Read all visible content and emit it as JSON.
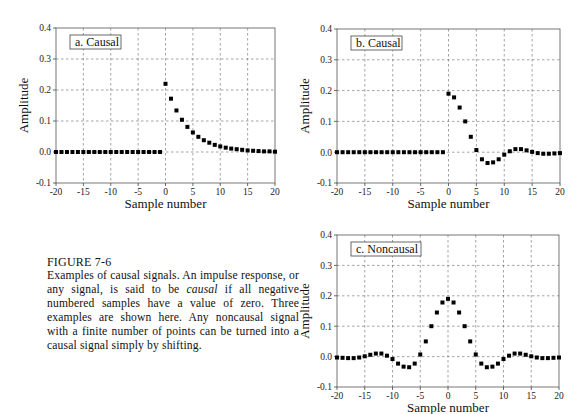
{
  "caption": {
    "title": "FIGURE 7-6",
    "body_part1": "Examples of causal signals. An impulse response, or any signal, is said to be ",
    "body_italic": "causal",
    "body_part2": " if all negative numbered samples have a value of zero.  Three examples are shown here. Any noncausal signal with a finite number of points can be turned into a causal signal simply by shifting."
  },
  "chart_data": [
    {
      "id": "a",
      "type": "scatter",
      "title": "a.  Causal",
      "xlabel": "Sample number",
      "ylabel": "Amplitude",
      "xlim": [
        -20,
        20
      ],
      "ylim": [
        -0.1,
        0.4
      ],
      "xticks": [
        -20,
        -15,
        -10,
        -5,
        0,
        5,
        10,
        15,
        20
      ],
      "yticks": [
        "-0.1",
        "0.0",
        "0.1",
        "0.2",
        "0.3",
        "0.4"
      ],
      "grid": true,
      "x": [
        -20,
        -19,
        -18,
        -17,
        -16,
        -15,
        -14,
        -13,
        -12,
        -11,
        -10,
        -9,
        -8,
        -7,
        -6,
        -5,
        -4,
        -3,
        -2,
        -1,
        0,
        1,
        2,
        3,
        4,
        5,
        6,
        7,
        8,
        9,
        10,
        11,
        12,
        13,
        14,
        15,
        16,
        17,
        18,
        19,
        20
      ],
      "y": [
        0,
        0,
        0,
        0,
        0,
        0,
        0,
        0,
        0,
        0,
        0,
        0,
        0,
        0,
        0,
        0,
        0,
        0,
        0,
        0,
        0.22,
        0.172,
        0.134,
        0.104,
        0.081,
        0.063,
        0.049,
        0.038,
        0.03,
        0.023,
        0.018,
        0.014,
        0.011,
        0.009,
        0.007,
        0.005,
        0.004,
        0.003,
        0.002,
        0.002,
        0.001
      ]
    },
    {
      "id": "b",
      "type": "scatter",
      "title": "b.  Causal",
      "xlabel": "Sample number",
      "ylabel": "Amplitude",
      "xlim": [
        -20,
        20
      ],
      "ylim": [
        -0.1,
        0.4
      ],
      "xticks": [
        -20,
        -15,
        -10,
        -5,
        0,
        5,
        10,
        15,
        20
      ],
      "yticks": [
        "-0.1",
        "0.0",
        "0.1",
        "0.2",
        "0.3",
        "0.4"
      ],
      "grid": true,
      "x": [
        -20,
        -19,
        -18,
        -17,
        -16,
        -15,
        -14,
        -13,
        -12,
        -11,
        -10,
        -9,
        -8,
        -7,
        -6,
        -5,
        -4,
        -3,
        -2,
        -1,
        0,
        1,
        2,
        3,
        4,
        5,
        6,
        7,
        8,
        9,
        10,
        11,
        12,
        13,
        14,
        15,
        16,
        17,
        18,
        19,
        20
      ],
      "y": [
        0,
        0,
        0,
        0,
        0,
        0,
        0,
        0,
        0,
        0,
        0,
        0,
        0,
        0,
        0,
        0,
        0,
        0,
        0,
        0,
        0.19,
        0.178,
        0.145,
        0.1,
        0.05,
        0.007,
        -0.023,
        -0.035,
        -0.033,
        -0.023,
        -0.008,
        0.003,
        0.01,
        0.01,
        0.006,
        0.001,
        -0.003,
        -0.005,
        -0.005,
        -0.004,
        -0.003
      ]
    },
    {
      "id": "c",
      "type": "scatter",
      "title": "c.  Noncausal",
      "xlabel": "Sample number",
      "ylabel": "Amplitude",
      "xlim": [
        -20,
        20
      ],
      "ylim": [
        -0.1,
        0.4
      ],
      "xticks": [
        -20,
        -15,
        -10,
        -5,
        0,
        5,
        10,
        15,
        20
      ],
      "yticks": [
        "-0.1",
        "0.0",
        "0.1",
        "0.2",
        "0.3",
        "0.4"
      ],
      "grid": true,
      "x": [
        -20,
        -19,
        -18,
        -17,
        -16,
        -15,
        -14,
        -13,
        -12,
        -11,
        -10,
        -9,
        -8,
        -7,
        -6,
        -5,
        -4,
        -3,
        -2,
        -1,
        0,
        1,
        2,
        3,
        4,
        5,
        6,
        7,
        8,
        9,
        10,
        11,
        12,
        13,
        14,
        15,
        16,
        17,
        18,
        19,
        20
      ],
      "y": [
        -0.003,
        -0.004,
        -0.005,
        -0.005,
        -0.003,
        0.001,
        0.006,
        0.01,
        0.01,
        0.003,
        -0.008,
        -0.023,
        -0.033,
        -0.035,
        -0.023,
        0.007,
        0.05,
        0.1,
        0.145,
        0.178,
        0.19,
        0.178,
        0.145,
        0.1,
        0.05,
        0.007,
        -0.023,
        -0.035,
        -0.033,
        -0.023,
        -0.008,
        0.003,
        0.01,
        0.01,
        0.006,
        0.001,
        -0.003,
        -0.005,
        -0.005,
        -0.004,
        -0.003
      ]
    }
  ]
}
